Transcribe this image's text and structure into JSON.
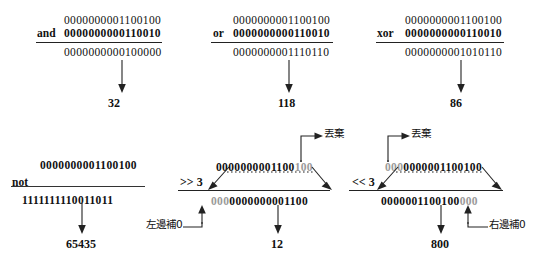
{
  "colors": {
    "ink": "#111111",
    "dim": "#9a9a9a",
    "rule": "#222222",
    "background": "#ffffff"
  },
  "top_row": {
    "operations": [
      {
        "id": "and",
        "operator_label": "and",
        "operand_a": "0000000001100100",
        "operand_b": "0000000000110010",
        "result_bits": "0000000000100000",
        "result_value": "32"
      },
      {
        "id": "or",
        "operator_label": "or",
        "operand_a": "0000000001100100",
        "operand_b": "0000000000110010",
        "result_bits": "0000000001110110",
        "result_value": "118"
      },
      {
        "id": "xor",
        "operator_label": "xor",
        "operand_a": "0000000001100100",
        "operand_b": "0000000000110010",
        "result_bits": "0000000001010110",
        "result_value": "86"
      }
    ]
  },
  "bottom_row": {
    "not_operation": {
      "id": "not",
      "operator_label": "not",
      "operand_a": "0000000001100100",
      "result_bits": "1111111110011011",
      "result_value": "65435"
    },
    "shift_right": {
      "id": "shift-right",
      "operator_label": ">> 3",
      "source_kept": "0000000001100",
      "source_discarded": "100",
      "result_padded": "000",
      "result_kept": "0000000001100",
      "result_value": "12",
      "discard_label": "丟棄",
      "pad_label": "左邊補0"
    },
    "shift_left": {
      "id": "shift-left",
      "operator_label": "<< 3",
      "source_discarded": "000",
      "source_kept": "0000001100100",
      "result_kept": "0000001100100",
      "result_padded": "000",
      "result_value": "800",
      "discard_label": "丟棄",
      "pad_label": "右邊補0"
    }
  }
}
